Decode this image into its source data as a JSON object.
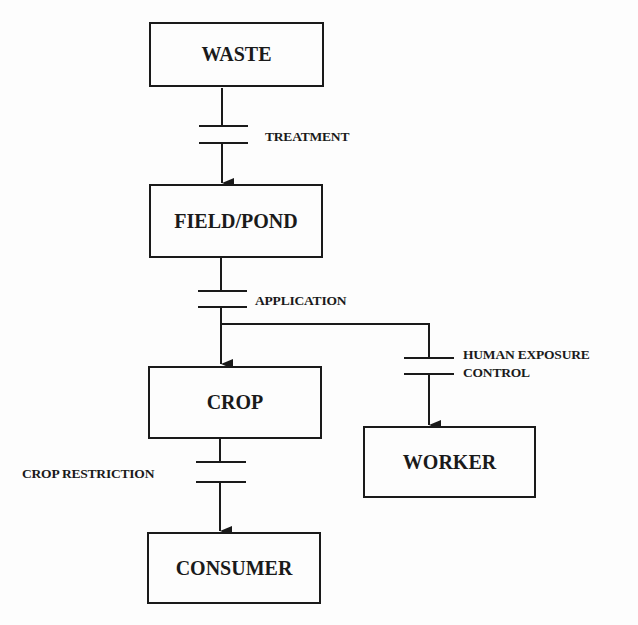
{
  "nodes": {
    "waste": "WASTE",
    "field_pond": "FIELD/POND",
    "crop": "CROP",
    "worker": "WORKER",
    "consumer": "CONSUMER"
  },
  "barriers": {
    "treatment": "TREATMENT",
    "application": "APPLICATION",
    "human_exposure_line1": "HUMAN EXPOSURE",
    "human_exposure_line2": "CONTROL",
    "crop_restriction": "CROP RESTRICTION"
  },
  "edges": [
    {
      "from": "WASTE",
      "to": "FIELD/POND",
      "barrier": "TREATMENT"
    },
    {
      "from": "FIELD/POND",
      "to": "CROP",
      "barrier": "APPLICATION"
    },
    {
      "from": "FIELD/POND",
      "to": "WORKER",
      "barrier": "HUMAN EXPOSURE CONTROL"
    },
    {
      "from": "CROP",
      "to": "CONSUMER",
      "barrier": "CROP RESTRICTION"
    }
  ],
  "colors": {
    "ink": "#1a1a1a",
    "background": "#fdfdfd"
  }
}
